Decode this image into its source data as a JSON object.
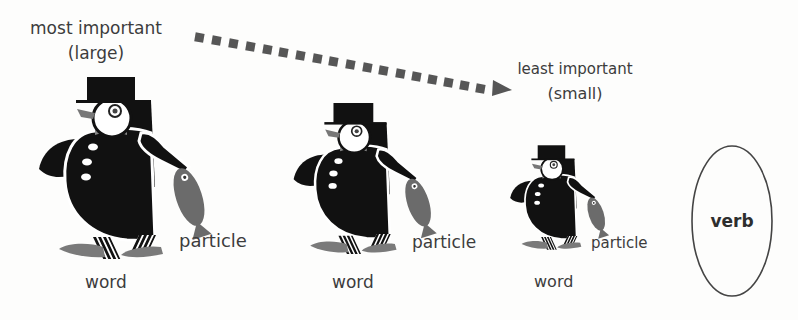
{
  "diagram": {
    "top_left_label": {
      "line1": "most important",
      "line2": "(large)"
    },
    "top_right_label": {
      "line1": "least important",
      "line2": "(small)"
    },
    "arrow": {
      "style": "dotted-squares",
      "direction": "left-to-right descending",
      "color": "#555555"
    },
    "figures": [
      {
        "size": "large",
        "icon": "penguin-with-top-hat-icon",
        "holds": "fish-icon",
        "word_label": "word",
        "particle_label": "particle"
      },
      {
        "size": "medium",
        "icon": "penguin-with-top-hat-icon",
        "holds": "fish-icon",
        "word_label": "word",
        "particle_label": "particle"
      },
      {
        "size": "small",
        "icon": "penguin-with-top-hat-icon",
        "holds": "fish-icon",
        "word_label": "word",
        "particle_label": "particle"
      }
    ],
    "verb_oval": {
      "label": "verb"
    },
    "colors": {
      "ink": "#111111",
      "gray_accent": "#6b6b6b",
      "text": "#3c3c3c",
      "background": "#fdfdfc"
    }
  }
}
